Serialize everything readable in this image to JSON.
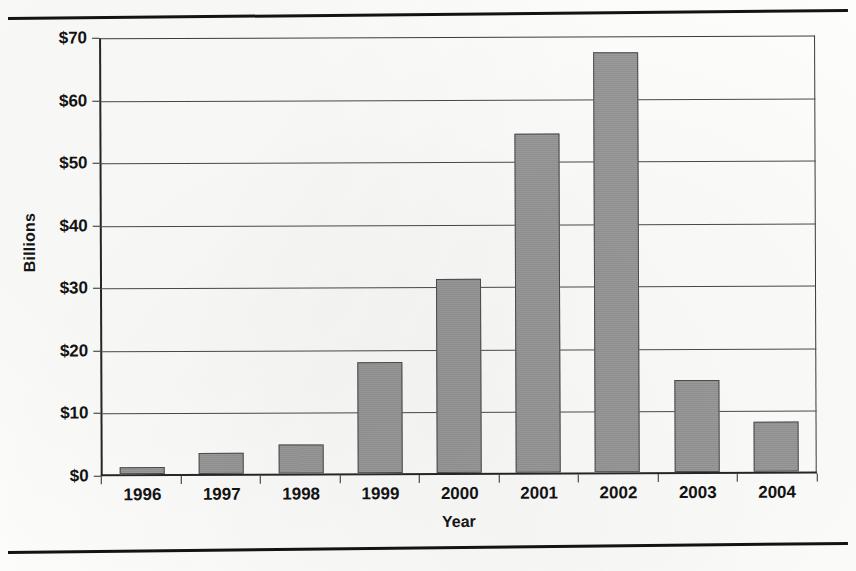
{
  "figure": {
    "top_rule": "horizontal-rule",
    "bottom_rule": "horizontal-rule"
  },
  "chart_data": {
    "type": "bar",
    "title": "",
    "xlabel": "Year",
    "ylabel": "Billions",
    "categories": [
      "1996",
      "1997",
      "1998",
      "1999",
      "2000",
      "2001",
      "2002",
      "2003",
      "2004"
    ],
    "values": [
      1.2,
      3.4,
      4.6,
      17.9,
      31.1,
      54.4,
      67.4,
      14.8,
      8.0
    ],
    "ylim": [
      0,
      70
    ],
    "ytick_values": [
      0,
      10,
      20,
      30,
      40,
      50,
      60,
      70
    ],
    "ytick_labels": [
      "$0",
      "$10",
      "$20",
      "$30",
      "$40",
      "$50",
      "$60",
      "$70"
    ],
    "grid": "horizontal",
    "legend": "none",
    "bar_color": "#969696",
    "bar_border_color": "#4d4d4d",
    "axis_color": "#262626",
    "gridline_color": "#4a4a4a"
  }
}
